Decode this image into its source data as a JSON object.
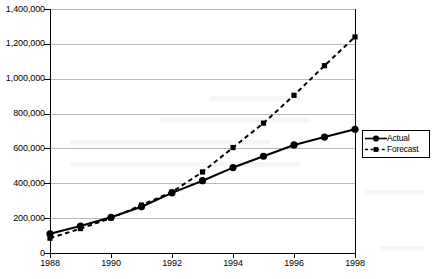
{
  "chart_data": {
    "type": "line",
    "title": "",
    "xlabel": "",
    "ylabel": "",
    "x": [
      1988,
      1989,
      1990,
      1991,
      1992,
      1993,
      1994,
      1995,
      1996,
      1997,
      1998
    ],
    "categories": [
      "1988",
      "1989",
      "1990",
      "1991",
      "1992",
      "1993",
      "1994",
      "1995",
      "1996",
      "1997",
      "1998"
    ],
    "series": [
      {
        "name": "Actual",
        "style": "solid",
        "marker": "circle",
        "color": "#000000",
        "values": [
          110000,
          155000,
          205000,
          265000,
          345000,
          415000,
          490000,
          555000,
          620000,
          665000,
          710000
        ]
      },
      {
        "name": "Forecast",
        "style": "dashed",
        "marker": "square",
        "color": "#000000",
        "values": [
          85000,
          140000,
          200000,
          275000,
          350000,
          465000,
          605000,
          745000,
          905000,
          1075000,
          1240000
        ]
      }
    ],
    "ylim": [
      0,
      1400000
    ],
    "xlim": [
      1988,
      1998
    ],
    "yticks": [
      0,
      200000,
      400000,
      600000,
      800000,
      1000000,
      1200000,
      1400000
    ],
    "ytick_labels": [
      "0",
      "200,000",
      "400,000",
      "600,000",
      "800,000",
      "1,000,000",
      "1,200,000",
      "1,400,000"
    ],
    "xticks": [
      1988,
      1990,
      1992,
      1994,
      1996,
      1998
    ],
    "xtick_labels": [
      "1988",
      "1990",
      "1992",
      "1994",
      "1996",
      "1998"
    ],
    "grid": "horizontal",
    "legend_position": "right",
    "legend_entries": [
      "Actual",
      "Forecast"
    ]
  }
}
